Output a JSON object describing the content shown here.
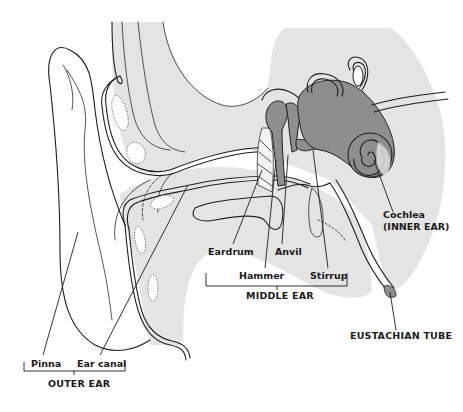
{
  "diagram": {
    "colors": {
      "background": "#ffffff",
      "tissue_light_gray": "#e4e4e4",
      "inner_ear_dark_gray": "#8e8e8e",
      "ink": "#1e1e1e"
    },
    "labels": {
      "pinna": "Pinna",
      "ear_canal": "Ear canal",
      "eardrum": "Eardrum",
      "hammer": "Hammer",
      "anvil": "Anvil",
      "stirrup": "Stirrup",
      "cochlea": "Cochlea",
      "inner_ear": "(INNER EAR)",
      "eustachian_tube": "EUSTACHIAN TUBE"
    },
    "groups": {
      "outer_ear": {
        "label": "OUTER EAR",
        "members": [
          "Pinna",
          "Ear canal"
        ]
      },
      "middle_ear": {
        "label": "MIDDLE EAR",
        "members": [
          "Eardrum",
          "Hammer",
          "Anvil",
          "Stirrup"
        ]
      },
      "inner_ear": {
        "label": "(INNER EAR)",
        "members": [
          "Cochlea"
        ]
      }
    }
  }
}
